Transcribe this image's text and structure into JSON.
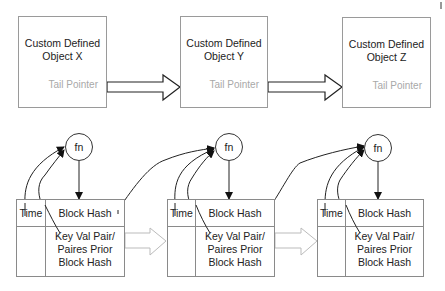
{
  "objects": [
    {
      "title_line1": "Custom Defined",
      "title_line2": "Object X",
      "tail": "Tail Pointer"
    },
    {
      "title_line1": "Custom Defined",
      "title_line2": "Object Y",
      "tail": "Tail Pointer"
    },
    {
      "title_line1": "Custom Defined",
      "title_line2": "Object Z",
      "tail": "Tail Pointer"
    }
  ],
  "blocks": [
    {
      "fn": "fn",
      "time": "Time",
      "hash": "Block Hash",
      "kv_line1": "Key Val Pair/",
      "kv_line2": "Paires Prior",
      "kv_line3": "Block Hash"
    },
    {
      "fn": "fn",
      "time": "Time",
      "hash": "Block Hash",
      "kv_line1": "Key Val Pair/",
      "kv_line2": "Paires Prior",
      "kv_line3": "Block Hash"
    },
    {
      "fn": "fn",
      "time": "Time",
      "hash": "Block Hash",
      "kv_line1": "Key Val Pair/",
      "kv_line2": "Paires Prior",
      "kv_line3": "Block Hash"
    }
  ],
  "colors": {
    "stroke": "#333333",
    "box_border": "#9a9a9a",
    "tail_text": "#a8a8a8",
    "chain_arrow": "#bbbbbb"
  }
}
